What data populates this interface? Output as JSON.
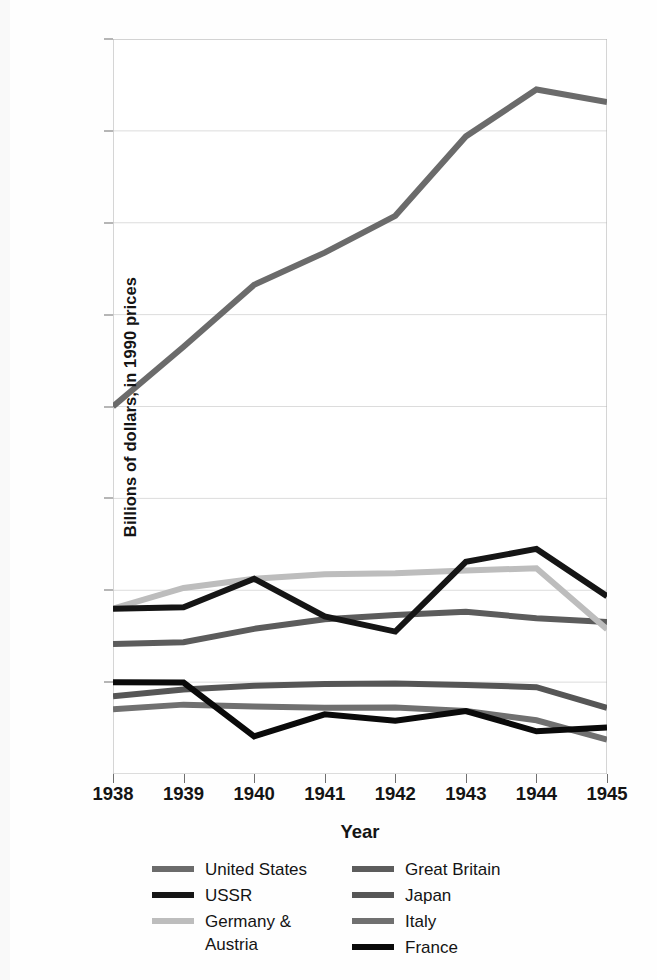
{
  "chart_data": {
    "type": "line",
    "title": "",
    "xlabel": "Year",
    "ylabel": "Billions of dollars, in 1990 prices",
    "x": [
      1938,
      1939,
      1940,
      1941,
      1942,
      1943,
      1944,
      1945
    ],
    "xtick_labels": [
      "1938",
      "1939",
      "1940",
      "1941",
      "1942",
      "1943",
      "1944",
      "1945"
    ],
    "ytick_labels": [
      "$1,600",
      "1,400",
      "1,200",
      "1,000",
      "800",
      "600",
      "400",
      "200"
    ],
    "ytick_values": [
      1600,
      1400,
      1200,
      1000,
      800,
      600,
      400,
      200
    ],
    "ylim": [
      0,
      1600
    ],
    "xlim": [
      1938,
      1945
    ],
    "grid": true,
    "legend_position": "bottom",
    "series": [
      {
        "name": "United States",
        "color": "#6b6b6b",
        "width": 6,
        "values": [
          800,
          930,
          1065,
          1135,
          1215,
          1388,
          1490,
          1463
        ]
      },
      {
        "name": "Great Britain",
        "color": "#5c5c5c",
        "width": 6,
        "values": [
          283,
          287,
          316,
          337,
          346,
          353,
          339,
          331
        ]
      },
      {
        "name": "USSR",
        "color": "#151515",
        "width": 6,
        "values": [
          360,
          363,
          425,
          343,
          310,
          462,
          490,
          387
        ]
      },
      {
        "name": "Japan",
        "color": "#565656",
        "width": 6,
        "values": [
          169,
          184,
          192,
          196,
          197,
          194,
          189,
          144
        ]
      },
      {
        "name": "Germany &\nAustria",
        "color": "#bdbdbd",
        "width": 6,
        "values": [
          360,
          405,
          425,
          435,
          437,
          443,
          448,
          315
        ]
      },
      {
        "name": "Italy",
        "color": "#707070",
        "width": 6,
        "values": [
          141,
          151,
          147,
          144,
          145,
          137,
          117,
          75
        ]
      },
      {
        "name": "France",
        "color": "#0a0a0a",
        "width": 6,
        "values": [
          200,
          199,
          82,
          130,
          116,
          137,
          93,
          101
        ]
      }
    ]
  },
  "legend": {
    "left_column": [
      {
        "label": "United States",
        "series": "United States"
      },
      {
        "label": "USSR",
        "series": "USSR"
      },
      {
        "label": "Germany &\nAustria",
        "series": "Germany & Austria"
      }
    ],
    "right_column": [
      {
        "label": "Great Britain",
        "series": "Great Britain"
      },
      {
        "label": "Japan",
        "series": "Japan"
      },
      {
        "label": "Italy",
        "series": "Italy"
      },
      {
        "label": "France",
        "series": "France"
      }
    ]
  },
  "axis": {
    "x_label": "Year",
    "y_label": "Billions of dollars, in 1990 prices"
  }
}
